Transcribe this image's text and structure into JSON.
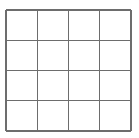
{
  "figure": {
    "name": "grid-figure",
    "type": "grid",
    "background_color": "#ffffff",
    "line_color": "#6d6d6d",
    "cell_fill_color": "#ffffff",
    "line_width": 1.35,
    "rows": 4,
    "columns": 4,
    "cell_count": 16,
    "geometry": {
      "left": 6,
      "top": 10,
      "right": 131,
      "bottom": 131,
      "width": 125,
      "height": 121,
      "cell_width": 31.25,
      "cell_height": 30.25
    },
    "vertical_line_x": [
      6,
      37.25,
      68.5,
      99.75,
      131
    ],
    "horizontal_line_y": [
      10,
      40.25,
      70.5,
      100.75,
      131
    ],
    "cells": [
      {
        "row": 0,
        "col": 0,
        "label": ""
      },
      {
        "row": 0,
        "col": 1,
        "label": ""
      },
      {
        "row": 0,
        "col": 2,
        "label": ""
      },
      {
        "row": 0,
        "col": 3,
        "label": ""
      },
      {
        "row": 1,
        "col": 0,
        "label": ""
      },
      {
        "row": 1,
        "col": 1,
        "label": ""
      },
      {
        "row": 1,
        "col": 2,
        "label": ""
      },
      {
        "row": 1,
        "col": 3,
        "label": ""
      },
      {
        "row": 2,
        "col": 0,
        "label": ""
      },
      {
        "row": 2,
        "col": 1,
        "label": ""
      },
      {
        "row": 2,
        "col": 2,
        "label": ""
      },
      {
        "row": 2,
        "col": 3,
        "label": ""
      },
      {
        "row": 3,
        "col": 0,
        "label": ""
      },
      {
        "row": 3,
        "col": 1,
        "label": ""
      },
      {
        "row": 3,
        "col": 2,
        "label": ""
      },
      {
        "row": 3,
        "col": 3,
        "label": ""
      }
    ]
  }
}
